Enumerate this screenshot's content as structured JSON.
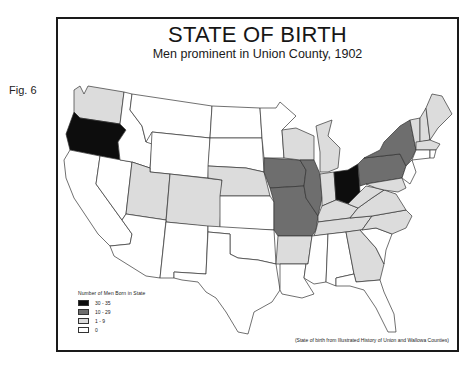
{
  "figure_label": "Fig. 6",
  "title": "STATE OF BIRTH",
  "subtitle": "Men prominent in Union County, 1902",
  "legend": {
    "title": "Number of Men Born in State",
    "items": [
      {
        "label": "30 - 35",
        "color": "#0d0d0d"
      },
      {
        "label": "10 - 29",
        "color": "#6e6e6e"
      },
      {
        "label": "1 - 9",
        "color": "#dcdcdc"
      },
      {
        "label": "0",
        "color": "#ffffff"
      }
    ]
  },
  "source": "(State of birth from Illustrated History of Union and Wallowa Counties)",
  "state_categories": {
    "30 - 35": [
      "Oregon",
      "Ohio"
    ],
    "10 - 29": [
      "Iowa",
      "Missouri",
      "Illinois",
      "New York",
      "Pennsylvania"
    ],
    "1 - 9": [
      "Washington",
      "Utah",
      "Colorado",
      "Nebraska",
      "Wisconsin",
      "Michigan",
      "Indiana",
      "Kentucky",
      "Tennessee",
      "Arkansas",
      "West Virginia",
      "Virginia",
      "North Carolina",
      "Georgia",
      "Vermont",
      "New Hampshire",
      "Maine",
      "Massachusetts",
      "Maryland"
    ],
    "0": [
      "California",
      "Nevada",
      "Idaho",
      "Montana",
      "Wyoming",
      "Arizona",
      "New Mexico",
      "Texas",
      "Oklahoma",
      "Kansas",
      "South Dakota",
      "North Dakota",
      "Minnesota",
      "Louisiana",
      "Mississippi",
      "Alabama",
      "Florida",
      "South Carolina",
      "New Jersey",
      "Connecticut",
      "Rhode Island",
      "Delaware"
    ]
  }
}
